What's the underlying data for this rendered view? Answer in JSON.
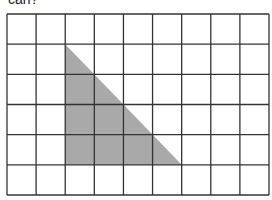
{
  "caption": "can?",
  "grid": {
    "cols": 9,
    "rows": 6,
    "x0": 7,
    "y0": 14,
    "x1": 269,
    "y1": 195,
    "line_color": "#333333"
  },
  "shape": {
    "type": "right-triangle",
    "fill": "#a9a9a9",
    "vertices_grid": [
      [
        2,
        1
      ],
      [
        2,
        5
      ],
      [
        6,
        5
      ]
    ]
  }
}
